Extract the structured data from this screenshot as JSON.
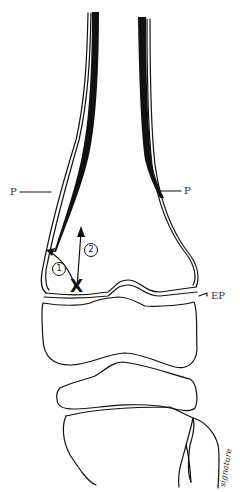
{
  "figure": {
    "type": "anatomical line drawing",
    "labels": {
      "periosteum_left": "P",
      "periosteum_right": "P",
      "epiphyseal_plate": "EP"
    },
    "markers": {
      "fracture_site": "X",
      "path_1": "1",
      "path_2": "2"
    },
    "signature": "signature",
    "colors": {
      "ink": "#111111",
      "background": "#ffffff",
      "label_text": "#333333"
    }
  }
}
